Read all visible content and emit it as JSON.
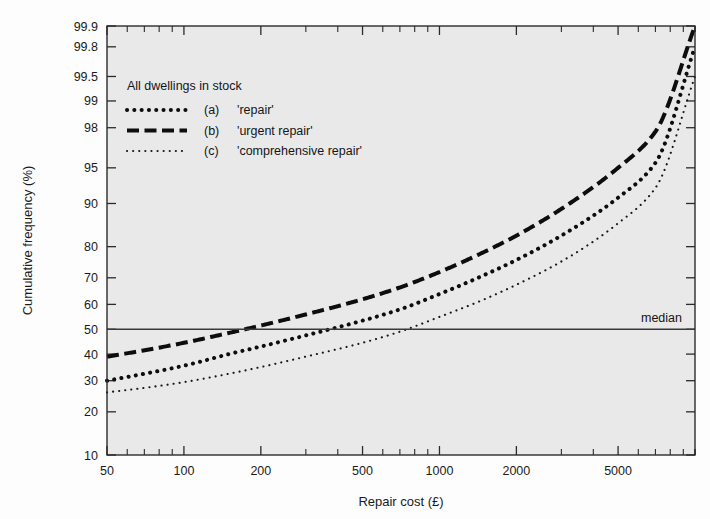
{
  "figure": {
    "background_color": "#fdfdfd",
    "plot_background_color": "#e9e9e9",
    "frame_color": "#2b2b2b"
  },
  "annotations": {
    "median_label": "median"
  },
  "legend": {
    "title": "All dwellings in stock",
    "entries": [
      {
        "key": "(a)",
        "label": "'repair'",
        "style": "thick-dotted"
      },
      {
        "key": "(b)",
        "label": "'urgent repair'",
        "style": "dashed"
      },
      {
        "key": "(c)",
        "label": "'comprehensive repair'",
        "style": "fine-dotted"
      }
    ]
  },
  "chart_data": {
    "type": "line",
    "title": "",
    "subtitle": "",
    "xlabel": "Repair cost (£)",
    "ylabel": "Cumulative frequency (%)",
    "xscale": "log",
    "yscale": "probit",
    "xlim": [
      50,
      10000
    ],
    "ylim": [
      10,
      99.9
    ],
    "grid": false,
    "legend_position": "upper-left-inside",
    "xticks": [
      50,
      100,
      200,
      500,
      1000,
      2000,
      5000
    ],
    "xtick_labels": [
      "50",
      "100",
      "200",
      "500",
      "1000",
      "2000",
      "5000"
    ],
    "yticks": [
      10,
      20,
      30,
      40,
      50,
      60,
      70,
      80,
      90,
      95,
      98,
      99,
      99.5,
      99.8,
      99.9
    ],
    "ytick_labels": [
      "10",
      "20",
      "30",
      "40",
      "50",
      "60",
      "70",
      "80",
      "90",
      "95",
      "98",
      "99",
      "99.5",
      "99.8",
      "99.9"
    ],
    "annotation_lines": [
      {
        "name": "median",
        "orientation": "horizontal",
        "y": 50,
        "label": "median"
      }
    ],
    "series": [
      {
        "name": "(a) 'repair'",
        "style": "thick-dotted",
        "x": [
          50,
          70,
          100,
          150,
          200,
          300,
          500,
          700,
          1000,
          1500,
          2000,
          3000,
          5000,
          7000,
          10000
        ],
        "y": [
          30,
          32.5,
          35.5,
          40,
          43,
          47.5,
          53.5,
          58,
          64,
          71,
          76,
          83,
          91,
          95.5,
          99.8
        ]
      },
      {
        "name": "(b) 'urgent repair'",
        "style": "dashed",
        "x": [
          50,
          70,
          100,
          150,
          200,
          300,
          500,
          700,
          1000,
          1500,
          2000,
          3000,
          5000,
          7000,
          10000
        ],
        "y": [
          39,
          41.5,
          44.5,
          48.5,
          51.5,
          56,
          62,
          66.5,
          72,
          78.5,
          83,
          89,
          95,
          97.8,
          99.9
        ]
      },
      {
        "name": "(c) 'comprehensive repair'",
        "style": "fine-dotted",
        "x": [
          50,
          70,
          100,
          150,
          200,
          300,
          500,
          700,
          1000,
          1500,
          2000,
          3000,
          5000,
          7000,
          10000
        ],
        "y": [
          26,
          27.5,
          29.5,
          32.5,
          35,
          39,
          44.5,
          49,
          55,
          62,
          67.5,
          75.5,
          86,
          92.5,
          99.5
        ]
      }
    ]
  }
}
